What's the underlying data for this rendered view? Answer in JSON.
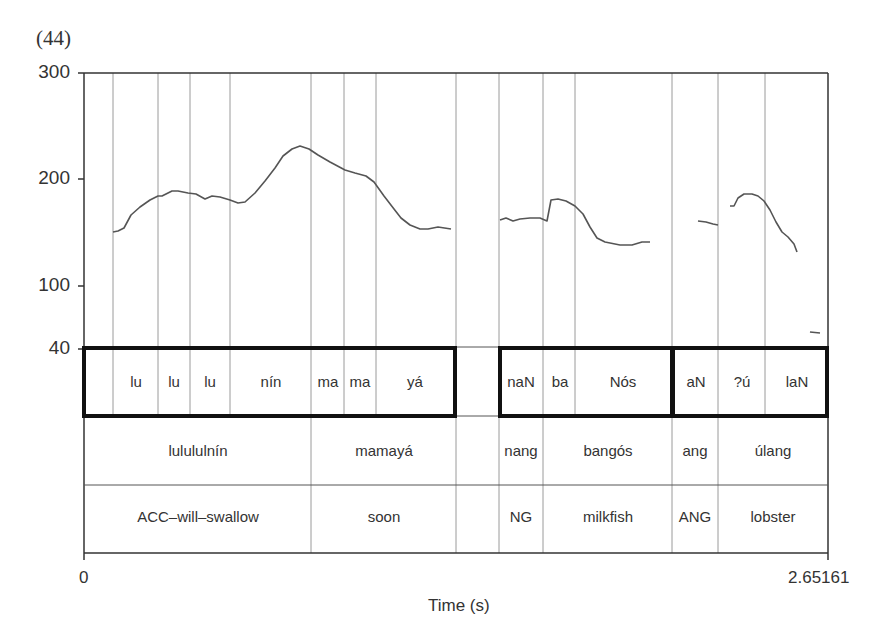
{
  "example_number": "(44)",
  "chart_data": {
    "type": "line",
    "title": "",
    "xlabel": "Time (s)",
    "ylabel": "",
    "xlim": [
      0,
      2.65161
    ],
    "x_tick_labels": [
      "0",
      "2.65161"
    ],
    "y_tick_labels": [
      "300",
      "200",
      "100",
      "40"
    ],
    "ylim": [
      40,
      300
    ],
    "grid": "vertical segment boundaries",
    "series": [
      {
        "name": "pitch contour segment 1 (lulununín mamayá)",
        "pixels": [
          [
            113,
            232
          ],
          [
            118,
            231
          ],
          [
            124,
            228
          ],
          [
            131,
            215
          ],
          [
            140,
            207
          ],
          [
            150,
            200
          ],
          [
            158,
            196
          ],
          [
            162,
            196
          ],
          [
            172,
            191
          ],
          [
            178,
            191
          ],
          [
            188,
            193
          ],
          [
            196,
            194
          ],
          [
            205,
            199
          ],
          [
            212,
            196
          ],
          [
            220,
            197
          ],
          [
            230,
            200
          ],
          [
            238,
            203
          ],
          [
            245,
            202
          ],
          [
            255,
            193
          ],
          [
            265,
            181
          ],
          [
            275,
            168
          ],
          [
            283,
            156
          ],
          [
            292,
            149
          ],
          [
            300,
            146
          ],
          [
            309,
            149
          ],
          [
            318,
            155
          ],
          [
            330,
            162
          ],
          [
            345,
            170
          ],
          [
            355,
            173
          ],
          [
            366,
            176
          ],
          [
            374,
            182
          ],
          [
            384,
            196
          ],
          [
            394,
            209
          ],
          [
            401,
            218
          ],
          [
            410,
            225
          ],
          [
            420,
            229
          ],
          [
            428,
            229
          ],
          [
            438,
            227
          ],
          [
            451,
            229
          ]
        ]
      },
      {
        "name": "pitch contour segment 2 (nang bangós)",
        "pixels": [
          [
            500,
            220
          ],
          [
            506,
            218
          ],
          [
            513,
            221
          ],
          [
            520,
            219
          ],
          [
            530,
            218
          ],
          [
            540,
            218
          ],
          [
            547,
            221
          ],
          [
            551,
            200
          ],
          [
            558,
            199
          ],
          [
            566,
            201
          ],
          [
            575,
            206
          ],
          [
            583,
            214
          ],
          [
            590,
            227
          ],
          [
            597,
            238
          ],
          [
            605,
            242
          ],
          [
            620,
            245
          ],
          [
            632,
            245
          ],
          [
            642,
            242
          ],
          [
            650,
            242
          ]
        ]
      },
      {
        "name": "pitch contour segment 3 (ang)",
        "pixels": [
          [
            698,
            221
          ],
          [
            706,
            222
          ],
          [
            713,
            224
          ],
          [
            718,
            225
          ]
        ]
      },
      {
        "name": "pitch contour segment 4 (úlang)",
        "pixels": [
          [
            730,
            206
          ],
          [
            734,
            206
          ],
          [
            738,
            198
          ],
          [
            744,
            194
          ],
          [
            752,
            194
          ],
          [
            758,
            196
          ],
          [
            764,
            201
          ],
          [
            770,
            210
          ],
          [
            776,
            222
          ],
          [
            782,
            232
          ],
          [
            788,
            237
          ],
          [
            794,
            244
          ],
          [
            797,
            252
          ]
        ]
      },
      {
        "name": "pitch fragment",
        "pixels": [
          [
            810,
            332
          ],
          [
            820,
            333
          ]
        ]
      }
    ],
    "approx_values_hz": {
      "segment1": {
        "start": 150,
        "plateau": 187,
        "peak": 232,
        "end": 152
      },
      "segment2": {
        "start": 162,
        "peak": 182,
        "end": 140
      },
      "segment3": {
        "start": 160,
        "end": 156
      },
      "segment4": {
        "start": 175,
        "peak": 187,
        "end": 130
      }
    },
    "tiers": [
      {
        "name": "syllables",
        "cells": [
          "",
          "lu",
          "lu",
          "lu",
          "nín",
          "ma",
          "ma",
          "yá",
          "",
          "naN",
          "ba",
          "Nós",
          "aN",
          "?ú",
          "laN"
        ]
      },
      {
        "name": "words",
        "cells": [
          "lulululnín",
          "mamayá",
          "",
          "nang",
          "bangós",
          "ang",
          "úlang"
        ]
      },
      {
        "name": "gloss",
        "cells": [
          "ACC–will–swallow",
          "soon",
          "",
          "NG",
          "milkfish",
          "ANG",
          "lobster"
        ]
      }
    ]
  },
  "axis": {
    "y_labels": [
      "300",
      "200",
      "100",
      "40"
    ],
    "x_start": "0",
    "x_end": "2.65161",
    "x_title": "Time (s)"
  },
  "tier1": {
    "s1": "lu",
    "s2": "lu",
    "s3": "lu",
    "s4": "nín",
    "s5": "ma",
    "s6": "ma",
    "s7": "yá",
    "s8": "naN",
    "s9": "ba",
    "s10": "Nós",
    "s11": "aN",
    "s12": "?ú",
    "s13": "laN"
  },
  "tier2": {
    "w1": "lulululnín",
    "w2": "mamayá",
    "w3": "nang",
    "w4": "bangós",
    "w5": "ang",
    "w6": "úlang"
  },
  "tier3": {
    "g1": "ACC–will–swallow",
    "g2": "soon",
    "g3": "NG",
    "g4": "milkfish",
    "g5": "ANG",
    "g6": "lobster"
  }
}
